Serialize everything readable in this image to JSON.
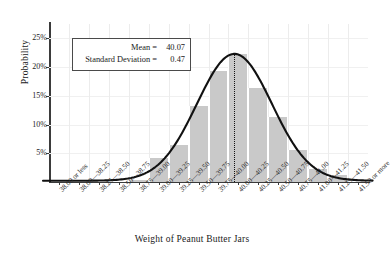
{
  "chart_data": {
    "type": "bar",
    "title": "",
    "xlabel": "Weight of Peanut Butter Jars",
    "ylabel": "Probability",
    "grid": true,
    "legend": "none",
    "ylim": [
      0,
      27.5
    ],
    "ytick_labels": [
      "5%",
      "10%",
      "15%",
      "20%",
      "25%"
    ],
    "ytick_values": [
      5,
      10,
      15,
      20,
      25
    ],
    "categories": [
      "38.00 or less",
      "38.00—38.25",
      "38.25—38.50",
      "38.50—38.75",
      "38.75—39.00",
      "39.00—39.25",
      "39.25—39.50",
      "39.50—39.75",
      "39.75—40.00",
      "40.00—40.25",
      "40.25—40.50",
      "40.50—40.75",
      "40.75—41.00",
      "41.00—41.25",
      "41.25—41.50",
      "41.50 or more"
    ],
    "values": [
      0.0,
      0.0,
      0.0,
      0.0,
      0.3,
      4.2,
      6.5,
      13.2,
      19.3,
      22.3,
      16.3,
      11.3,
      5.5,
      2.2,
      1.2,
      0.0
    ],
    "overlay_curve": {
      "type": "normal-density",
      "mean": 40.07,
      "std": 0.47,
      "peak_percent": 22.3
    },
    "mean_marker": {
      "style": "dotted-vertical-line",
      "value": 40.07
    },
    "annotation": {
      "mean_label": "Mean =",
      "mean_value": "40.07",
      "std_label": "Standard Deviation =",
      "std_value": "0.47"
    },
    "colors": {
      "bar_fill": "#c9c9c9",
      "curve": "#111111",
      "axis": "#3b3b3b",
      "grid": "#ececec",
      "text": "#1a1a1a"
    }
  }
}
